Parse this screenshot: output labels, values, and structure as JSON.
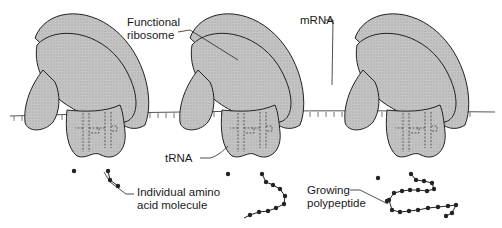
{
  "diagram": {
    "type": "translation-ribosome-sequence",
    "stages": 3,
    "colors": {
      "ribosome_fill": "#bdbdbd",
      "outline": "#222222",
      "mrna_line": "#555555",
      "background": "#ffffff"
    },
    "labels": {
      "functional_ribosome": [
        "Functional",
        "ribosome"
      ],
      "mrna": "mRNA",
      "trna": "tRNA",
      "amino_acid": [
        "Individual amino",
        "acid molecule"
      ],
      "polypeptide": [
        "Growing",
        "polypeptide"
      ]
    }
  }
}
